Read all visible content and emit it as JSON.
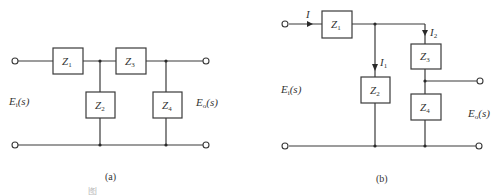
{
  "figure_a": {
    "caption": "(a)",
    "input_label": {
      "base": "E",
      "sub": "i",
      "arg": "(s)"
    },
    "output_label": {
      "base": "E",
      "sub": "o",
      "arg": "(s)"
    },
    "impedances": [
      {
        "base": "Z",
        "sub": "1",
        "position": "series-top-left"
      },
      {
        "base": "Z",
        "sub": "2",
        "position": "shunt-left"
      },
      {
        "base": "Z",
        "sub": "3",
        "position": "series-top-right"
      },
      {
        "base": "Z",
        "sub": "4",
        "position": "shunt-right"
      }
    ]
  },
  "figure_b": {
    "caption": "(b)",
    "input_label": {
      "base": "E",
      "sub": "i",
      "arg": "(s)"
    },
    "output_label": {
      "base": "E",
      "sub": "o",
      "arg": "(s)"
    },
    "currents": [
      {
        "base": "I",
        "sub": ""
      },
      {
        "base": "I",
        "sub": "1"
      },
      {
        "base": "I",
        "sub": "2"
      }
    ],
    "impedances": [
      {
        "base": "Z",
        "sub": "1",
        "position": "series-input"
      },
      {
        "base": "Z",
        "sub": "2",
        "position": "shunt"
      },
      {
        "base": "Z",
        "sub": "3",
        "position": "upper-divider"
      },
      {
        "base": "Z",
        "sub": "4",
        "position": "lower-divider"
      }
    ]
  },
  "caption_line": {
    "prefix": "图",
    "note": "clipped / illegible"
  }
}
